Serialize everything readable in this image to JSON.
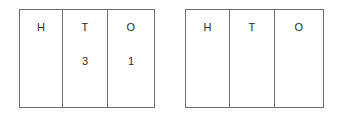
{
  "worksheet": {
    "title": "Place value tables",
    "ink_color": "#2b2b2b",
    "border_color": "#6e6e6e",
    "background_color": "#ffffff"
  },
  "tables": [
    {
      "name": "place-value-table-filled",
      "columns": [
        {
          "header": "H",
          "digit": ""
        },
        {
          "header": "T",
          "digit": "3"
        },
        {
          "header": "O",
          "digit": "1"
        }
      ]
    },
    {
      "name": "place-value-table-blank",
      "columns": [
        {
          "header": "H",
          "digit": ""
        },
        {
          "header": "T",
          "digit": ""
        },
        {
          "header": "O",
          "digit": ""
        }
      ]
    }
  ]
}
